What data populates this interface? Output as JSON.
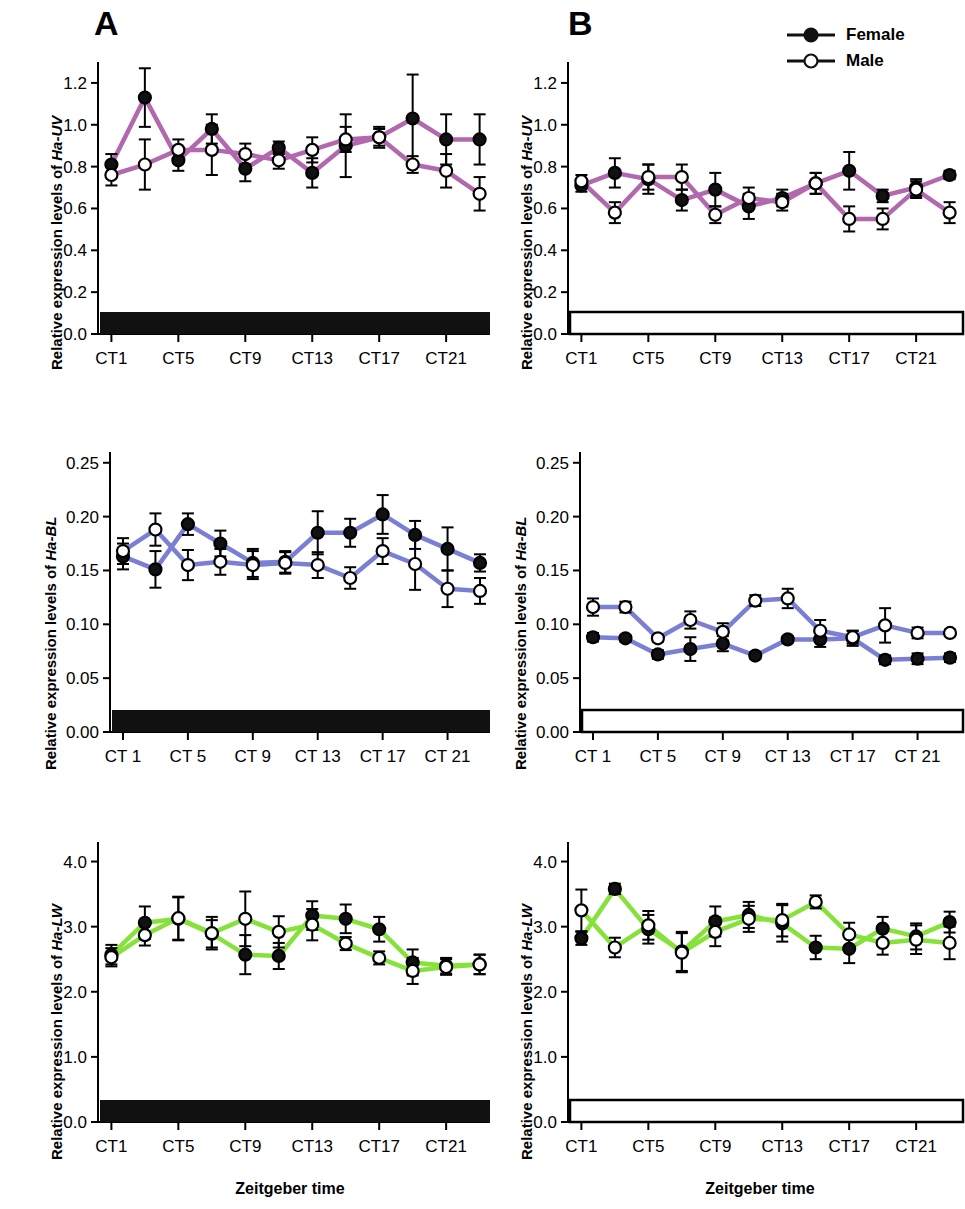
{
  "figure": {
    "panels": [
      {
        "letter": "A",
        "condition": "constant-dark",
        "bar_style": "filled-black"
      },
      {
        "letter": "B",
        "condition": "light-dark",
        "bar_style": "outlined-white"
      }
    ],
    "legend": {
      "items": [
        {
          "label": "Female",
          "marker": "filled-circle",
          "color": "#1a1a1a"
        },
        {
          "label": "Male",
          "marker": "open-circle",
          "color": "#1a1a1a"
        }
      ]
    },
    "axis_title_x": "Zeitgeber time",
    "y_axis_prefix": "Relative expression levels of ",
    "gene_names": [
      "Ha-UV",
      "Ha-BL",
      "Ha-LW"
    ],
    "series_colors": {
      "Ha-UV": "#b168ad",
      "Ha-BL": "#7b7fd4",
      "Ha-LW": "#86e23b"
    }
  },
  "chart_data": [
    {
      "id": "A-UV",
      "type": "line",
      "panel": "A",
      "title": "",
      "xlabel": "Zeitgeber time",
      "ylabel": "Relative expression levels of Ha-UV",
      "line_color": "#b168ad",
      "ylim": [
        0.0,
        1.3
      ],
      "yticks": [
        0.0,
        0.2,
        0.4,
        0.6,
        0.8,
        1.0,
        1.2
      ],
      "ytick_labels": [
        "0.0",
        "0.2",
        "0.4",
        "0.6",
        "0.8",
        "1.0",
        "1.2"
      ],
      "x": [
        1,
        3,
        5,
        7,
        9,
        11,
        13,
        15,
        17,
        19,
        21,
        23
      ],
      "xticks": [
        1,
        5,
        9,
        13,
        17,
        21
      ],
      "xtick_labels": [
        "CT1",
        "CT5",
        "CT9",
        "CT13",
        "CT17",
        "CT21"
      ],
      "grid": false,
      "legend_position": "none",
      "light_bar": "dark",
      "series": [
        {
          "name": "Female",
          "marker": "filled-circle",
          "values": [
            0.81,
            1.13,
            0.83,
            0.98,
            0.79,
            0.89,
            0.77,
            0.9,
            0.94,
            1.03,
            0.93,
            0.93
          ],
          "errors": [
            0.05,
            0.14,
            0.05,
            0.07,
            0.06,
            0.03,
            0.07,
            0.15,
            0.05,
            0.21,
            0.12,
            0.12
          ]
        },
        {
          "name": "Male",
          "marker": "open-circle",
          "values": [
            0.76,
            0.81,
            0.88,
            0.88,
            0.86,
            0.83,
            0.88,
            0.93,
            0.94,
            0.81,
            0.78,
            0.67
          ],
          "errors": [
            0.05,
            0.12,
            0.05,
            0.12,
            0.05,
            0.04,
            0.06,
            0.06,
            0.04,
            0.04,
            0.08,
            0.08
          ]
        }
      ]
    },
    {
      "id": "B-UV",
      "type": "line",
      "panel": "B",
      "title": "",
      "xlabel": "Zeitgeber time",
      "ylabel": "Relative expression levels of Ha-UV",
      "line_color": "#b168ad",
      "ylim": [
        0.0,
        1.3
      ],
      "yticks": [
        0.0,
        0.2,
        0.4,
        0.6,
        0.8,
        1.0,
        1.2
      ],
      "ytick_labels": [
        "0.0",
        "0.2",
        "0.4",
        "0.6",
        "0.8",
        "1.0",
        "1.2"
      ],
      "x": [
        1,
        3,
        5,
        7,
        9,
        11,
        13,
        15,
        17,
        19,
        21,
        23
      ],
      "xticks": [
        1,
        5,
        9,
        13,
        17,
        21
      ],
      "xtick_labels": [
        "CT1",
        "CT5",
        "CT9",
        "CT13",
        "CT17",
        "CT21"
      ],
      "grid": false,
      "legend_position": "top-right",
      "light_bar": "light",
      "series": [
        {
          "name": "Female",
          "marker": "filled-circle",
          "values": [
            0.71,
            0.77,
            0.74,
            0.64,
            0.69,
            0.61,
            0.65,
            0.72,
            0.78,
            0.66,
            0.7,
            0.76
          ],
          "errors": [
            0.03,
            0.07,
            0.07,
            0.05,
            0.08,
            0.06,
            0.04,
            0.05,
            0.09,
            0.03,
            0.04,
            0.02
          ]
        },
        {
          "name": "Male",
          "marker": "open-circle",
          "values": [
            0.73,
            0.58,
            0.75,
            0.75,
            0.57,
            0.65,
            0.63,
            0.72,
            0.55,
            0.55,
            0.69,
            0.58
          ],
          "errors": [
            0.03,
            0.05,
            0.06,
            0.06,
            0.04,
            0.05,
            0.04,
            0.05,
            0.06,
            0.05,
            0.04,
            0.05
          ]
        }
      ]
    },
    {
      "id": "A-BL",
      "type": "line",
      "panel": "A",
      "title": "",
      "xlabel": "Zeitgeber time",
      "ylabel": "Relative expression levels of Ha-BL",
      "line_color": "#7b7fd4",
      "ylim": [
        0.0,
        0.26
      ],
      "yticks": [
        0.0,
        0.05,
        0.1,
        0.15,
        0.2,
        0.25
      ],
      "ytick_labels": [
        "0.00",
        "0.05",
        "0.10",
        "0.15",
        "0.20",
        "0.25"
      ],
      "x": [
        1,
        3,
        5,
        7,
        9,
        11,
        13,
        15,
        17,
        19,
        21,
        23
      ],
      "xticks": [
        1,
        5,
        9,
        13,
        17,
        21
      ],
      "xtick_labels": [
        "CT 1",
        "CT 5",
        "CT 9",
        "CT 13",
        "CT 17",
        "CT 21"
      ],
      "grid": false,
      "legend_position": "none",
      "light_bar": "dark",
      "series": [
        {
          "name": "Female",
          "marker": "filled-circle",
          "values": [
            0.163,
            0.151,
            0.193,
            0.175,
            0.157,
            0.158,
            0.185,
            0.185,
            0.202,
            0.183,
            0.17,
            0.157
          ],
          "errors": [
            0.012,
            0.017,
            0.01,
            0.012,
            0.013,
            0.01,
            0.02,
            0.013,
            0.018,
            0.013,
            0.02,
            0.008
          ]
        },
        {
          "name": "Male",
          "marker": "open-circle",
          "values": [
            0.168,
            0.188,
            0.155,
            0.158,
            0.155,
            0.157,
            0.155,
            0.143,
            0.168,
            0.156,
            0.133,
            0.131
          ],
          "errors": [
            0.012,
            0.015,
            0.014,
            0.012,
            0.013,
            0.01,
            0.012,
            0.01,
            0.012,
            0.024,
            0.017,
            0.012
          ]
        }
      ]
    },
    {
      "id": "B-BL",
      "type": "line",
      "panel": "B",
      "title": "",
      "xlabel": "Zeitgeber time",
      "ylabel": "Relative expression levels of Ha-BL",
      "line_color": "#7b7fd4",
      "ylim": [
        0.0,
        0.26
      ],
      "yticks": [
        0.0,
        0.05,
        0.1,
        0.15,
        0.2,
        0.25
      ],
      "ytick_labels": [
        "0.00",
        "0.05",
        "0.10",
        "0.15",
        "0.20",
        "0.25"
      ],
      "x": [
        1,
        3,
        5,
        7,
        9,
        11,
        13,
        15,
        17,
        19,
        21,
        23
      ],
      "xticks": [
        1,
        5,
        9,
        13,
        17,
        21
      ],
      "xtick_labels": [
        "CT 1",
        "CT 5",
        "CT 9",
        "CT 13",
        "CT 17",
        "CT 21"
      ],
      "grid": false,
      "legend_position": "none",
      "light_bar": "light",
      "series": [
        {
          "name": "Female",
          "marker": "filled-circle",
          "values": [
            0.088,
            0.087,
            0.072,
            0.077,
            0.082,
            0.071,
            0.086,
            0.086,
            0.087,
            0.067,
            0.068,
            0.069
          ],
          "errors": [
            0.004,
            0.003,
            0.004,
            0.011,
            0.007,
            0.003,
            0.003,
            0.007,
            0.007,
            0.004,
            0.005,
            0.004
          ]
        },
        {
          "name": "Male",
          "marker": "open-circle",
          "values": [
            0.116,
            0.116,
            0.087,
            0.104,
            0.093,
            0.122,
            0.124,
            0.094,
            0.088,
            0.099,
            0.092,
            0.092
          ],
          "errors": [
            0.008,
            0.005,
            0.003,
            0.008,
            0.008,
            0.005,
            0.009,
            0.01,
            0.006,
            0.016,
            0.005,
            0.003
          ]
        }
      ]
    },
    {
      "id": "A-LW",
      "type": "line",
      "panel": "A",
      "title": "",
      "xlabel": "Zeitgeber time",
      "ylabel": "Relative expression levels of Ha-LW",
      "line_color": "#86e23b",
      "ylim": [
        0.0,
        4.3
      ],
      "yticks": [
        0.0,
        1.0,
        2.0,
        3.0,
        4.0
      ],
      "ytick_labels": [
        "0.0",
        "1.0",
        "2.0",
        "3.0",
        "4.0"
      ],
      "x": [
        1,
        3,
        5,
        7,
        9,
        11,
        13,
        15,
        17,
        19,
        21,
        23
      ],
      "xticks": [
        1,
        5,
        9,
        13,
        17,
        21
      ],
      "xtick_labels": [
        "CT1",
        "CT5",
        "CT9",
        "CT13",
        "CT17",
        "CT21"
      ],
      "grid": false,
      "legend_position": "none",
      "light_bar": "dark",
      "series": [
        {
          "name": "Female",
          "marker": "filled-circle",
          "values": [
            2.57,
            3.06,
            3.12,
            2.89,
            2.57,
            2.55,
            3.17,
            3.12,
            2.96,
            2.45,
            2.4,
            2.42
          ],
          "errors": [
            0.15,
            0.25,
            0.33,
            0.21,
            0.3,
            0.2,
            0.22,
            0.22,
            0.19,
            0.2,
            0.12,
            0.15
          ]
        },
        {
          "name": "Male",
          "marker": "open-circle",
          "values": [
            2.53,
            2.87,
            3.13,
            2.9,
            3.12,
            2.92,
            3.03,
            2.74,
            2.52,
            2.32,
            2.38,
            2.42
          ],
          "errors": [
            0.14,
            0.16,
            0.33,
            0.25,
            0.42,
            0.24,
            0.24,
            0.1,
            0.1,
            0.2,
            0.12,
            0.15
          ]
        }
      ]
    },
    {
      "id": "B-LW",
      "type": "line",
      "panel": "B",
      "title": "",
      "xlabel": "Zeitgeber time",
      "ylabel": "Relative expression levels of Ha-LW",
      "line_color": "#86e23b",
      "ylim": [
        0.0,
        4.3
      ],
      "yticks": [
        0.0,
        1.0,
        2.0,
        3.0,
        4.0
      ],
      "ytick_labels": [
        "0.0",
        "1.0",
        "2.0",
        "3.0",
        "4.0"
      ],
      "x": [
        1,
        3,
        5,
        7,
        9,
        11,
        13,
        15,
        17,
        19,
        21,
        23
      ],
      "xticks": [
        1,
        5,
        9,
        13,
        17,
        21
      ],
      "xtick_labels": [
        "CT1",
        "CT5",
        "CT9",
        "CT13",
        "CT17",
        "CT21"
      ],
      "grid": false,
      "legend_position": "none",
      "light_bar": "light",
      "series": [
        {
          "name": "Female",
          "marker": "filled-circle",
          "values": [
            2.82,
            3.58,
            2.96,
            2.62,
            3.08,
            3.18,
            3.05,
            2.68,
            2.66,
            2.97,
            2.85,
            3.07
          ],
          "errors": [
            0.1,
            0.08,
            0.22,
            0.3,
            0.23,
            0.2,
            0.28,
            0.18,
            0.22,
            0.18,
            0.2,
            0.16
          ]
        },
        {
          "name": "Male",
          "marker": "open-circle",
          "values": [
            3.25,
            2.68,
            3.02,
            2.6,
            2.92,
            3.12,
            3.1,
            3.38,
            2.88,
            2.75,
            2.8,
            2.75
          ],
          "errors": [
            0.32,
            0.15,
            0.22,
            0.3,
            0.22,
            0.2,
            0.25,
            0.1,
            0.18,
            0.18,
            0.22,
            0.25
          ]
        }
      ]
    }
  ]
}
